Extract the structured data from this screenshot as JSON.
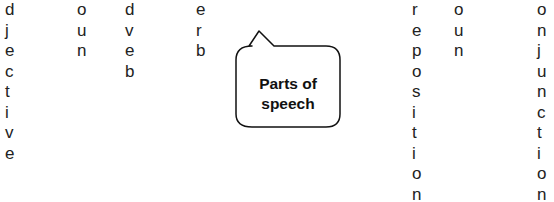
{
  "columns": [
    {
      "name": "adjective-fragment",
      "x": 5,
      "letters": [
        "d",
        "j",
        "e",
        "c",
        "t",
        "i",
        "v",
        "e"
      ]
    },
    {
      "name": "noun-fragment-1",
      "x": 77,
      "letters": [
        "o",
        "u",
        "n"
      ]
    },
    {
      "name": "adverb-fragment",
      "x": 125,
      "letters": [
        "d",
        "v",
        "e",
        "b"
      ]
    },
    {
      "name": "verb-fragment",
      "x": 196,
      "letters": [
        "e",
        "r",
        "b"
      ]
    },
    {
      "name": "preposition-fragment",
      "x": 412,
      "letters": [
        "r",
        "e",
        "p",
        "o",
        "s",
        "i",
        "t",
        "i",
        "o",
        "n"
      ]
    },
    {
      "name": "noun-fragment-2",
      "x": 454,
      "letters": [
        "o",
        "u",
        "n"
      ]
    },
    {
      "name": "conjunction-fragment",
      "x": 537,
      "letters": [
        "o",
        "n",
        "j",
        "u",
        "n",
        "c",
        "t",
        "i",
        "o",
        "n"
      ]
    }
  ],
  "bubble": {
    "line1": "Parts of",
    "line2": "speech"
  }
}
